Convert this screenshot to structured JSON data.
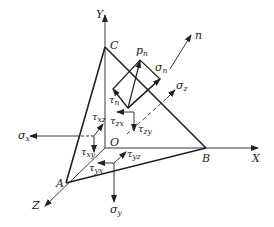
{
  "figure": {
    "line_color": "#222222",
    "background": "#ffffff"
  },
  "axes": {
    "x": "X",
    "y": "Y",
    "z": "Z",
    "origin": "O"
  },
  "vertices": {
    "a": "A",
    "b": "B",
    "c": "C"
  },
  "oblique_plane": {
    "normal": "n",
    "total_stress": {
      "symbol": "p",
      "sub": "n"
    },
    "normal_stress": {
      "symbol": "σ",
      "sub": "n"
    },
    "shear_stress": {
      "symbol": "τ",
      "sub": "n"
    }
  },
  "stresses": {
    "sigma_x": {
      "symbol": "σ",
      "sub": "x"
    },
    "sigma_y": {
      "symbol": "σ",
      "sub": "y"
    },
    "sigma_z": {
      "symbol": "σ",
      "sub": "z"
    },
    "tau_xy": {
      "symbol": "τ",
      "sub": "xy"
    },
    "tau_xz": {
      "symbol": "τ",
      "sub": "xz"
    },
    "tau_yx": {
      "symbol": "τ",
      "sub": "yx"
    },
    "tau_yz": {
      "symbol": "τ",
      "sub": "yz"
    },
    "tau_zx": {
      "symbol": "τ",
      "sub": "zx"
    },
    "tau_zy": {
      "symbol": "τ",
      "sub": "zy"
    }
  }
}
